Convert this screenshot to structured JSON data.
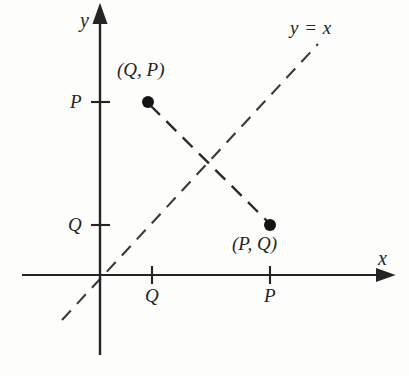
{
  "figure": {
    "kind": "cartesian-coordinate-diagram",
    "background_color": "#fdfdfc",
    "ink_color": "#242424"
  },
  "axes": {
    "x_axis_label": "x",
    "y_axis_label": "y",
    "x_axis": {
      "y_px": 275,
      "x_start_px": 22,
      "x_end_px": 385,
      "arrow": "right"
    },
    "y_axis": {
      "x_px": 100,
      "y_start_px": 355,
      "y_end_px": 15,
      "arrow": "up"
    },
    "origin": {
      "x_px": 100,
      "y_px": 275
    }
  },
  "ticks": {
    "x_ticks": [
      {
        "label": "Q",
        "x_px": 152
      },
      {
        "label": "P",
        "x_px": 270
      }
    ],
    "y_ticks": [
      {
        "label": "P",
        "y_px": 102
      },
      {
        "label": "Q",
        "y_px": 225
      }
    ]
  },
  "points": [
    {
      "label": "(Q, P)",
      "x_px": 148,
      "y_px": 102,
      "marker": "filled-circle"
    },
    {
      "label": "(P, Q)",
      "x_px": 270,
      "y_px": 225,
      "marker": "filled-circle"
    }
  ],
  "lines": [
    {
      "name": "identity-line",
      "label": "y = x",
      "style": "dashed",
      "from": {
        "x_px": 62,
        "y_px": 320
      },
      "to": {
        "x_px": 320,
        "y_px": 42
      }
    },
    {
      "name": "reflection-segment",
      "label": "",
      "style": "dashed",
      "from": {
        "x_px": 148,
        "y_px": 102
      },
      "to": {
        "x_px": 270,
        "y_px": 225
      }
    }
  ],
  "crossing_point": {
    "x_px": 209,
    "y_px": 164
  },
  "labels": {
    "y_equals_x": "y = x",
    "point_qp": "(Q, P)",
    "point_pq": "(P, Q)",
    "axis_x": "x",
    "axis_y": "y",
    "tick_y_p": "P",
    "tick_y_q": "Q",
    "tick_x_q": "Q",
    "tick_x_p": "P"
  }
}
